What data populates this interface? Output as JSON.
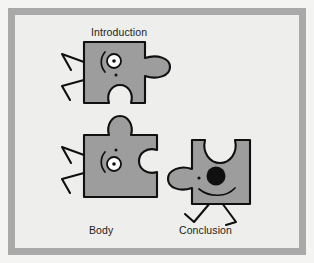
{
  "figure": {
    "kind": "illustration",
    "frame_color": "#a9a9a9",
    "background_color": "#eeeeec",
    "outer_color": "#f4f4f2",
    "piece_fill": "#9d9d9d",
    "piece_stroke": "#101010",
    "eye_fill": "#ffffff",
    "pupil_fill": "#101010"
  },
  "labels": {
    "introduction": "Introduction",
    "body": "Body",
    "conclusion": "Conclusion"
  },
  "pieces": [
    {
      "id": "introduction",
      "label": "Introduction",
      "label_position": "above",
      "eye_style": "outlined",
      "has_arms": true,
      "has_legs": false,
      "notch_bottom": true,
      "tab_right": true
    },
    {
      "id": "body",
      "label": "Body",
      "label_position": "below",
      "eye_style": "outlined",
      "has_arms": true,
      "has_legs": false,
      "tab_top": true,
      "notch_right": true
    },
    {
      "id": "conclusion",
      "label": "Conclusion",
      "label_position": "below",
      "eye_style": "solid",
      "has_arms": false,
      "has_legs": true,
      "notch_top": true,
      "tab_left": true,
      "has_smile": true
    }
  ]
}
